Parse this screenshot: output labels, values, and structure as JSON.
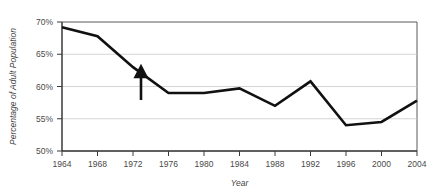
{
  "chart_data": {
    "type": "line",
    "title": "",
    "subtitle": "",
    "xlabel": "Year",
    "ylabel": "Percentage of Adult Population",
    "x": [
      1964,
      1968,
      1972,
      1976,
      1980,
      1984,
      1988,
      1992,
      1996,
      2000,
      2004
    ],
    "categories": [
      "1964",
      "1968",
      "1972",
      "1976",
      "1980",
      "1984",
      "1988",
      "1992",
      "1996",
      "2000",
      "2004"
    ],
    "values": [
      69.2,
      67.8,
      63.0,
      59.0,
      59.0,
      59.7,
      57.0,
      60.8,
      54.0,
      54.5,
      57.8
    ],
    "series": [
      {
        "name": "Percentage of Adult Population",
        "values": [
          69.2,
          67.8,
          63.0,
          59.0,
          59.0,
          59.7,
          57.0,
          60.8,
          54.0,
          54.5,
          57.8
        ],
        "color": "#111111"
      }
    ],
    "xlim": [
      1962,
      2006
    ],
    "ylim": [
      50,
      70
    ],
    "ytick_labels": [
      "70%",
      "65%",
      "60%",
      "55%",
      "50%"
    ],
    "ytick_values": [
      70,
      65,
      60,
      55,
      50
    ],
    "xtick_labels": [
      "1964",
      "1968",
      "1972",
      "1976",
      "1980",
      "1984",
      "1988",
      "1992",
      "1996",
      "2000",
      "2004"
    ],
    "grid": "horizontal",
    "legend": "none",
    "legend_position": "none",
    "annotations": [
      {
        "type": "up-arrow",
        "x": 1972,
        "y_from": 54.5,
        "y_to": 59.3,
        "label": ""
      }
    ],
    "colors": {
      "line": "#111111",
      "gridline": "#c9c9c9",
      "axis": "#2b2b2b",
      "frame": "#5a5a5a",
      "text": "#3a3a3a",
      "background": "#ffffff"
    }
  }
}
